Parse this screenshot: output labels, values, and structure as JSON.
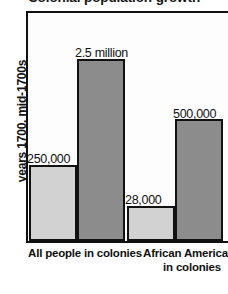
{
  "chart_data": {
    "type": "bar",
    "title": "Colonial population growth",
    "xlabel": "",
    "ylabel": "years 1700, mid-1700s",
    "grid": false,
    "legend": "none",
    "categories": [
      "All people in colonies",
      "African Americans in colonies"
    ],
    "series": [
      {
        "name": "1700",
        "shade": "light",
        "color": "#d2d2d2",
        "values": [
          250000,
          28000
        ],
        "value_labels": [
          "250,000",
          "28,000"
        ]
      },
      {
        "name": "mid-1700s",
        "shade": "dark",
        "color": "#8c8c8c",
        "values": [
          2500000,
          500000
        ],
        "value_labels": [
          "2.5 million",
          "500,000"
        ]
      }
    ],
    "bars": [
      {
        "label": "250,000",
        "value": 250000,
        "group": "All people in colonies",
        "period": "1700",
        "shade": "light",
        "left_pct": 0.5,
        "width_pct": 24.0,
        "height_pct": 33.5
      },
      {
        "label": "2.5 million",
        "value": 2500000,
        "group": "All people in colonies",
        "period": "mid-1700s",
        "shade": "dark",
        "left_pct": 24.5,
        "width_pct": 24.0,
        "height_pct": 80.0
      },
      {
        "label": "28,000",
        "value": 28000,
        "group": "African Americans in colonies",
        "period": "1700",
        "shade": "light",
        "left_pct": 49.5,
        "width_pct": 24.0,
        "height_pct": 15.5
      },
      {
        "label": "500,000",
        "value": 500000,
        "group": "African Americans in colonies",
        "period": "mid-1700s",
        "shade": "dark",
        "left_pct": 73.5,
        "width_pct": 24.0,
        "height_pct": 53.5
      }
    ],
    "ylim": [
      0,
      3125000
    ],
    "axis_colors": {
      "frame": "#111111",
      "light_bar": "#d2d2d2",
      "dark_bar": "#8c8c8c",
      "text": "#101010"
    }
  }
}
